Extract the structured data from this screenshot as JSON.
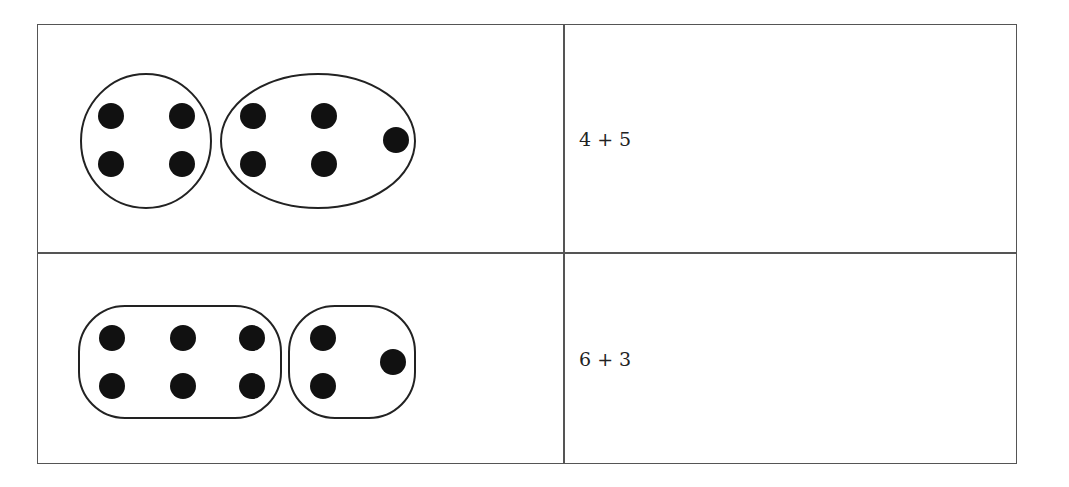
{
  "rows": [
    {
      "groups": [
        {
          "shape": "circle",
          "dot_count": 4
        },
        {
          "shape": "ellipse",
          "dot_count": 5
        }
      ],
      "expression": "4 + 5"
    },
    {
      "groups": [
        {
          "shape": "rounded-rectangle",
          "dot_count": 6
        },
        {
          "shape": "rounded-rectangle",
          "dot_count": 3
        }
      ],
      "expression": "6 + 3"
    }
  ],
  "colors": {
    "border": "#555555",
    "dot": "#111111",
    "outline": "#222222"
  }
}
